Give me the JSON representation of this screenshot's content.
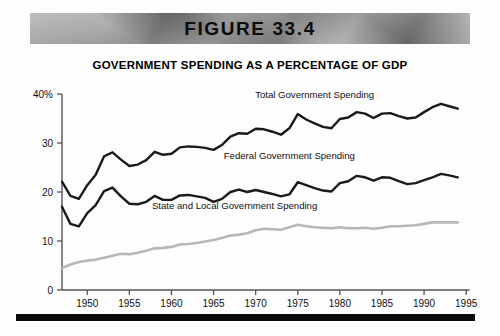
{
  "banner": {
    "label": "FIGURE 33.4"
  },
  "chart_data": {
    "type": "line",
    "title": "GOVERNMENT SPENDING AS A PERCENTAGE OF GDP",
    "xlabel": "",
    "ylabel": "",
    "xlim": [
      1947,
      1995
    ],
    "ylim": [
      0,
      40
    ],
    "grid": false,
    "legend_position": "inline-labels",
    "x_ticks": [
      1950,
      1955,
      1960,
      1965,
      1970,
      1975,
      1980,
      1985,
      1990,
      1995
    ],
    "x_tick_labels": [
      "1950",
      "1955",
      "1960",
      "1965",
      "1970",
      "1975",
      "1980",
      "1985",
      "1990",
      "1995"
    ],
    "y_ticks": [
      0,
      10,
      20,
      30,
      40
    ],
    "y_tick_labels": [
      "0",
      "10",
      "20",
      "30",
      "40%"
    ],
    "x": [
      1947,
      1948,
      1949,
      1950,
      1951,
      1952,
      1953,
      1954,
      1955,
      1956,
      1957,
      1958,
      1959,
      1960,
      1961,
      1962,
      1963,
      1964,
      1965,
      1966,
      1967,
      1968,
      1969,
      1970,
      1971,
      1972,
      1973,
      1974,
      1975,
      1976,
      1977,
      1978,
      1979,
      1980,
      1981,
      1982,
      1983,
      1984,
      1985,
      1986,
      1987,
      1988,
      1989,
      1990,
      1991,
      1992,
      1993,
      1994
    ],
    "series": [
      {
        "name": "Total Government Spending",
        "color": "#1a1a1a",
        "values": [
          22.1,
          19.2,
          18.6,
          21.4,
          23.5,
          27.3,
          28.1,
          26.6,
          25.3,
          25.6,
          26.5,
          28.2,
          27.6,
          27.8,
          29.1,
          29.3,
          29.2,
          29.0,
          28.6,
          29.6,
          31.3,
          32.0,
          31.9,
          32.9,
          32.8,
          32.3,
          31.7,
          33.0,
          35.9,
          34.8,
          34.0,
          33.3,
          33.0,
          34.9,
          35.2,
          36.3,
          36.0,
          35.1,
          36.0,
          36.1,
          35.5,
          35.0,
          35.2,
          36.3,
          37.3,
          38.0,
          37.5,
          37.0
        ]
      },
      {
        "name": "Federal Government Spending",
        "color": "#1a1a1a",
        "values": [
          17.0,
          13.5,
          13.0,
          15.7,
          17.3,
          20.2,
          20.9,
          19.1,
          17.6,
          17.5,
          18.0,
          19.2,
          18.4,
          18.4,
          19.3,
          19.4,
          19.1,
          18.8,
          18.0,
          18.6,
          20.0,
          20.5,
          20.0,
          20.4,
          20.0,
          19.6,
          19.1,
          19.5,
          22.0,
          21.4,
          20.8,
          20.3,
          20.1,
          21.8,
          22.2,
          23.3,
          23.0,
          22.3,
          23.0,
          22.9,
          22.2,
          21.6,
          21.8,
          22.4,
          23.0,
          23.7,
          23.4,
          23.0
        ]
      },
      {
        "name": "State and Local Government Spending",
        "color": "#b7b7b7",
        "values": [
          4.5,
          5.2,
          5.7,
          6.0,
          6.2,
          6.6,
          7.0,
          7.4,
          7.3,
          7.6,
          8.0,
          8.5,
          8.6,
          8.8,
          9.3,
          9.4,
          9.6,
          9.9,
          10.2,
          10.6,
          11.1,
          11.3,
          11.6,
          12.2,
          12.5,
          12.4,
          12.3,
          12.8,
          13.3,
          13.0,
          12.8,
          12.7,
          12.6,
          12.8,
          12.6,
          12.6,
          12.7,
          12.5,
          12.7,
          13.0,
          13.0,
          13.1,
          13.2,
          13.5,
          13.8,
          13.8,
          13.8,
          13.8
        ]
      }
    ],
    "annotations": [
      {
        "text": "Total Government Spending",
        "x": 1977,
        "y": 39.2
      },
      {
        "text": "Federal Government Spending",
        "x": 1974,
        "y": 26.7
      },
      {
        "text": "State and Local Government Spending",
        "x": 1967.5,
        "y": 16.6
      }
    ]
  }
}
